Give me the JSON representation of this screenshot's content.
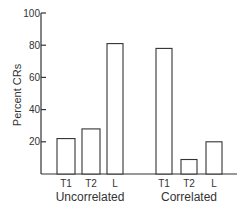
{
  "chart_data": {
    "type": "bar",
    "title": "",
    "xlabel": "",
    "ylabel": "Percent CRs",
    "ylim": [
      0,
      100
    ],
    "yticks": [
      20,
      40,
      60,
      80,
      100
    ],
    "grid": false,
    "legend": null,
    "groups": [
      {
        "name": "Uncorrelated",
        "categories": [
          "T1",
          "T2",
          "L"
        ],
        "values": [
          22,
          28,
          81
        ]
      },
      {
        "name": "Correlated",
        "categories": [
          "T1",
          "T2",
          "L"
        ],
        "values": [
          78,
          9,
          20
        ]
      }
    ],
    "bar_fill": "#ffffff",
    "bar_stroke": "#333333",
    "axis_color": "#333333"
  }
}
